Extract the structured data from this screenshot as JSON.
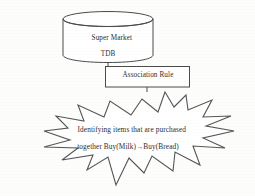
{
  "diagram": {
    "type": "flow-diagram",
    "background_color": "#fdfdfc",
    "stroke_color": "#4a4a4a",
    "text_color": "#2e2e2e",
    "nodes": [
      {
        "id": "database",
        "shape": "cylinder",
        "name": "super-market-database",
        "label_line1": "Super Market",
        "label_line2": "TDB"
      },
      {
        "id": "process",
        "shape": "rectangle",
        "name": "association-rule-box",
        "label": "Association Rule"
      },
      {
        "id": "result",
        "shape": "starburst",
        "name": "result-starburst",
        "label_line1": "Identifying items that are purchased",
        "label_line2": "together Buy(Milk)→Buy(Bread)"
      }
    ],
    "connectors": [
      {
        "name": "database-to-rule",
        "from": "database",
        "to": "process"
      },
      {
        "name": "rule-to-result",
        "from": "process",
        "to": "result"
      }
    ]
  }
}
